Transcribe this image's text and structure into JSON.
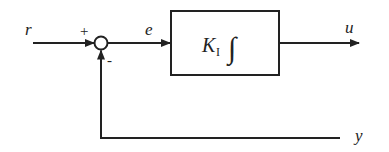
{
  "diagram": {
    "type": "block-diagram",
    "title": "",
    "signals": {
      "reference": "r",
      "error": "e",
      "output": "u",
      "feedback": "y"
    },
    "summing_junction": {
      "plus_sign": "+",
      "minus_sign": "-"
    },
    "block": {
      "gain_symbol": "K",
      "gain_subscript": "I",
      "operator": "∫"
    },
    "colors": {
      "line": "#222222",
      "background": "#ffffff"
    }
  }
}
